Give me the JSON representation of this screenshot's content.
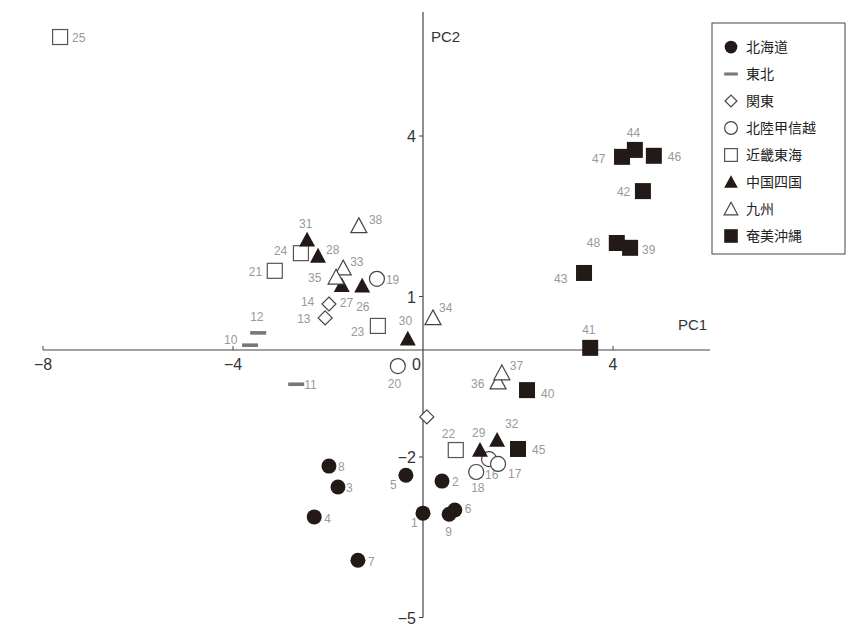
{
  "chart_data": {
    "type": "scatter",
    "title": "",
    "xlabel": "PC1",
    "ylabel": "PC2",
    "xlim": [
      -8,
      6
    ],
    "ylim": [
      -5,
      6
    ],
    "x_ticks": [
      -8,
      -4,
      0,
      4
    ],
    "y_ticks": [
      4,
      1,
      -2,
      -5
    ],
    "origin_label": "0",
    "grid": false,
    "legend_position": "upper right",
    "series": [
      {
        "name": "北海道",
        "marker": "filled-circle",
        "points": [
          {
            "id": "1",
            "x": 0.0,
            "y": -3.05
          },
          {
            "id": "2",
            "x": 0.4,
            "y": -2.45
          },
          {
            "id": "3",
            "x": -1.79,
            "y": -2.56
          },
          {
            "id": "4",
            "x": -2.29,
            "y": -3.12
          },
          {
            "id": "5",
            "x": -0.36,
            "y": -2.34
          },
          {
            "id": "6",
            "x": 0.67,
            "y": -2.99
          },
          {
            "id": "7",
            "x": -1.37,
            "y": -3.93
          },
          {
            "id": "8",
            "x": -1.98,
            "y": -2.17
          },
          {
            "id": "9",
            "x": 0.55,
            "y": -3.07
          }
        ]
      },
      {
        "name": "東北",
        "marker": "dash",
        "points": [
          {
            "id": "10",
            "x": -3.64,
            "y": 0.09
          },
          {
            "id": "11",
            "x": -2.67,
            "y": -0.64
          },
          {
            "id": "12",
            "x": -3.47,
            "y": 0.32
          }
        ]
      },
      {
        "name": "関東",
        "marker": "open-diamond",
        "points": [
          {
            "id": "13",
            "x": -2.06,
            "y": 0.6
          },
          {
            "id": "14",
            "x": -1.98,
            "y": 0.86
          },
          {
            "id": "",
            "x": 0.08,
            "y": -1.25
          }
        ]
      },
      {
        "name": "北陸甲信越",
        "marker": "open-circle",
        "points": [
          {
            "id": "16",
            "x": 1.39,
            "y": -2.04
          },
          {
            "id": "17",
            "x": 1.58,
            "y": -2.13
          },
          {
            "id": "18",
            "x": 1.12,
            "y": -2.28
          },
          {
            "id": "19",
            "x": -0.97,
            "y": 1.33
          },
          {
            "id": "20",
            "x": -0.53,
            "y": -0.3
          }
        ]
      },
      {
        "name": "近畿東海",
        "marker": "open-square",
        "points": [
          {
            "id": "21",
            "x": -3.12,
            "y": 1.48
          },
          {
            "id": "22",
            "x": 0.69,
            "y": -1.87
          },
          {
            "id": "23",
            "x": -0.95,
            "y": 0.45
          },
          {
            "id": "24",
            "x": -2.57,
            "y": 1.81
          },
          {
            "id": "25",
            "x": -7.64,
            "y": 5.85
          }
        ]
      },
      {
        "name": "中国四国",
        "marker": "filled-triangle",
        "points": [
          {
            "id": "26",
            "x": -1.28,
            "y": 1.2
          },
          {
            "id": "27",
            "x": -1.71,
            "y": 1.21
          },
          {
            "id": "28",
            "x": -2.21,
            "y": 1.76
          },
          {
            "id": "29",
            "x": 1.2,
            "y": -1.87
          },
          {
            "id": "30",
            "x": -0.32,
            "y": 0.21
          },
          {
            "id": "31",
            "x": -2.44,
            "y": 2.06
          },
          {
            "id": "32",
            "x": 1.56,
            "y": -1.68
          }
        ]
      },
      {
        "name": "九州",
        "marker": "open-triangle",
        "points": [
          {
            "id": "33",
            "x": -1.68,
            "y": 1.53
          },
          {
            "id": "34",
            "x": 0.21,
            "y": 0.6
          },
          {
            "id": "35",
            "x": -1.83,
            "y": 1.36
          },
          {
            "id": "36",
            "x": 1.58,
            "y": -0.6
          },
          {
            "id": "37",
            "x": 1.66,
            "y": -0.43
          },
          {
            "id": "38",
            "x": -1.35,
            "y": 2.32
          }
        ]
      },
      {
        "name": "奄美沖縄",
        "marker": "filled-square",
        "points": [
          {
            "id": "39",
            "x": 4.36,
            "y": 1.91
          },
          {
            "id": "40",
            "x": 2.19,
            "y": -0.75
          },
          {
            "id": "41",
            "x": 3.52,
            "y": 0.04
          },
          {
            "id": "42",
            "x": 4.63,
            "y": 2.97
          },
          {
            "id": "43",
            "x": 3.39,
            "y": 1.44
          },
          {
            "id": "44",
            "x": 4.46,
            "y": 3.74
          },
          {
            "id": "45",
            "x": 2.0,
            "y": -1.85
          },
          {
            "id": "46",
            "x": 4.86,
            "y": 3.63
          },
          {
            "id": "47",
            "x": 4.19,
            "y": 3.61
          },
          {
            "id": "48",
            "x": 4.08,
            "y": 2.0
          }
        ]
      }
    ]
  },
  "label_offsets": {
    "1": [
      -12,
      14
    ],
    "2": [
      10,
      5
    ],
    "3": [
      8,
      5
    ],
    "4": [
      10,
      6
    ],
    "5": [
      -16,
      14
    ],
    "6": [
      10,
      3
    ],
    "7": [
      10,
      6
    ],
    "8": [
      9,
      5
    ],
    "9": [
      -4,
      22
    ],
    "10": [
      -26,
      -1
    ],
    "11": [
      8,
      5
    ],
    "12": [
      -8,
      -12
    ],
    "13": [
      -28,
      5
    ],
    "14": [
      -28,
      2
    ],
    "16": [
      -4,
      20
    ],
    "17": [
      10,
      14
    ],
    "18": [
      -5,
      20
    ],
    "19": [
      9,
      5
    ],
    "20": [
      -10,
      22
    ],
    "21": [
      -26,
      5
    ],
    "22": [
      -14,
      -12
    ],
    "23": [
      -27,
      10
    ],
    "24": [
      -27,
      2
    ],
    "25": [
      12,
      5
    ],
    "26": [
      -6,
      25
    ],
    "27": [
      -2,
      22
    ],
    "28": [
      8,
      -2
    ],
    "29": [
      -8,
      -13
    ],
    "30": [
      -9,
      -14
    ],
    "31": [
      -8,
      -12
    ],
    "32": [
      8,
      -12
    ],
    "33": [
      7,
      -2
    ],
    "34": [
      6,
      -6
    ],
    "35": [
      -28,
      5
    ],
    "36": [
      -27,
      6
    ],
    "37": [
      8,
      -3
    ],
    "38": [
      10,
      -2
    ],
    "39": [
      12,
      6
    ],
    "40": [
      14,
      8
    ],
    "41": [
      -8,
      -14
    ],
    "42": [
      -26,
      5
    ],
    "43": [
      -30,
      10
    ],
    "44": [
      -8,
      -13
    ],
    "45": [
      14,
      5
    ],
    "46": [
      14,
      5
    ],
    "47": [
      -30,
      6
    ],
    "48": [
      -30,
      4
    ]
  }
}
